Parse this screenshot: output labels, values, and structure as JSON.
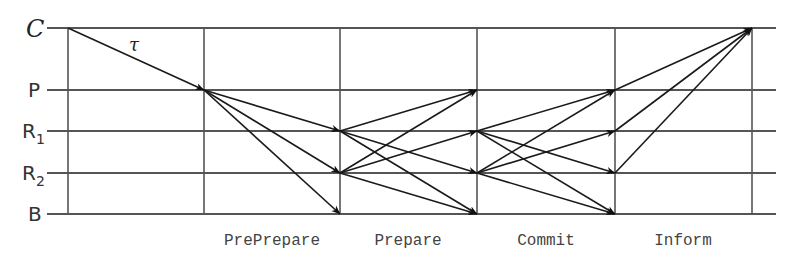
{
  "diagram": {
    "type": "message-sequence",
    "nodes": [
      {
        "id": "C",
        "label": "C",
        "y": 28,
        "style": "calligraphic"
      },
      {
        "id": "P",
        "label": "P",
        "y": 90
      },
      {
        "id": "R1",
        "label": "R",
        "subscript": "1",
        "y": 131
      },
      {
        "id": "R2",
        "label": "R",
        "subscript": "2",
        "y": 173
      },
      {
        "id": "B",
        "label": "B",
        "y": 214
      }
    ],
    "timeline_x": [
      68,
      204,
      340,
      477,
      615,
      752
    ],
    "phases": [
      {
        "label": "PrePrepare",
        "x": 272
      },
      {
        "label": "Prepare",
        "x": 408
      },
      {
        "label": "Commit",
        "x": 546
      },
      {
        "label": "Inform",
        "x": 683
      }
    ],
    "request_label": "τ",
    "messages": [
      {
        "phase": "Request",
        "from": "C",
        "to": "P"
      },
      {
        "phase": "PrePrepare",
        "from": "P",
        "to": "R1"
      },
      {
        "phase": "PrePrepare",
        "from": "P",
        "to": "R2"
      },
      {
        "phase": "PrePrepare",
        "from": "P",
        "to": "B"
      },
      {
        "phase": "Prepare",
        "from": "R1",
        "to": "P"
      },
      {
        "phase": "Prepare",
        "from": "R1",
        "to": "R2"
      },
      {
        "phase": "Prepare",
        "from": "R1",
        "to": "B"
      },
      {
        "phase": "Prepare",
        "from": "R2",
        "to": "P"
      },
      {
        "phase": "Prepare",
        "from": "R2",
        "to": "R1"
      },
      {
        "phase": "Prepare",
        "from": "R2",
        "to": "B"
      },
      {
        "phase": "Commit",
        "from": "R1",
        "to": "P"
      },
      {
        "phase": "Commit",
        "from": "R1",
        "to": "R2"
      },
      {
        "phase": "Commit",
        "from": "R1",
        "to": "B"
      },
      {
        "phase": "Commit",
        "from": "R2",
        "to": "P"
      },
      {
        "phase": "Commit",
        "from": "R2",
        "to": "R1"
      },
      {
        "phase": "Commit",
        "from": "R2",
        "to": "B"
      },
      {
        "phase": "Inform",
        "from": "P",
        "to": "C"
      },
      {
        "phase": "Inform",
        "from": "R1",
        "to": "C"
      },
      {
        "phase": "Inform",
        "from": "R2",
        "to": "C"
      }
    ]
  }
}
